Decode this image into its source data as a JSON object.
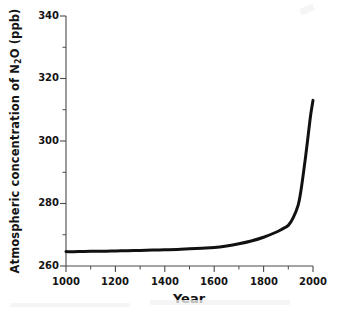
{
  "chart_data": {
    "type": "line",
    "title": "",
    "xlabel": "Year",
    "ylabel": "Atmospheric concentration of N2O (ppb)",
    "ylabel_parts": {
      "pre": "Atmospheric concentration of N",
      "sub": "2",
      "post": "O (ppb)"
    },
    "xlim": [
      1000,
      2000
    ],
    "ylim": [
      260,
      340
    ],
    "xticks": [
      1000,
      1200,
      1400,
      1600,
      1800,
      2000
    ],
    "xtick_labels": [
      "1000",
      "1200",
      "1400",
      "1600",
      "1800",
      "2000"
    ],
    "xminor_interval": 100,
    "yticks": [
      260,
      280,
      300,
      320,
      340
    ],
    "ytick_labels": [
      "260",
      "280",
      "300",
      "320",
      "340"
    ],
    "yminor_interval": 10,
    "grid": false,
    "legend": "none",
    "line_color": "#111111",
    "line_width_px": 3,
    "series": [
      {
        "name": "N2O concentration",
        "x": [
          1000,
          1050,
          1100,
          1150,
          1200,
          1250,
          1300,
          1350,
          1400,
          1450,
          1500,
          1550,
          1600,
          1650,
          1700,
          1750,
          1800,
          1850,
          1875,
          1900,
          1920,
          1940,
          1950,
          1960,
          1970,
          1980,
          1990,
          2000
        ],
        "values": [
          264.6,
          264.6,
          264.7,
          264.7,
          264.8,
          264.9,
          265.0,
          265.1,
          265.2,
          265.3,
          265.5,
          265.7,
          265.9,
          266.4,
          267.1,
          268.0,
          269.2,
          270.8,
          271.8,
          273.0,
          275.5,
          279.5,
          283.5,
          289.0,
          295.0,
          301.5,
          308.0,
          313.0
        ]
      }
    ]
  },
  "axes": {
    "spine_color": "#4a4a4a",
    "tick_color": "#4a4a4a"
  }
}
